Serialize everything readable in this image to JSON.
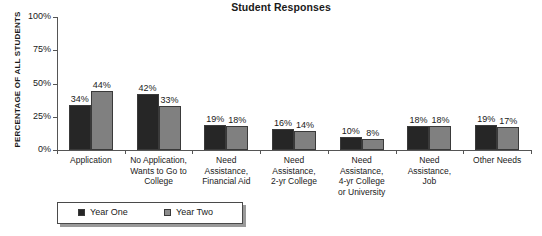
{
  "chart_data": {
    "type": "bar",
    "title": "Student Responses",
    "xlabel": "",
    "ylabel": "PERCENTAGE OF ALL STUDENTS",
    "ylim": [
      0,
      100
    ],
    "ytick_labels": [
      "0%",
      "25%",
      "50%",
      "75%",
      "100%"
    ],
    "ytick_values": [
      0,
      25,
      50,
      75,
      100
    ],
    "grid": false,
    "legend_position": "bottom-left",
    "categories": [
      "Application",
      "No Application, Wants to Go to College",
      "Need Assistance, Financial Aid",
      "Need Assistance, 2-yr College",
      "Need Assistance, 4-yr College or University",
      "Need Assistance, Job",
      "Other Needs"
    ],
    "category_lines": [
      [
        "Application"
      ],
      [
        "No Application,",
        "Wants to Go to",
        "College"
      ],
      [
        "Need",
        "Assistance,",
        "Financial Aid"
      ],
      [
        "Need",
        "Assistance,",
        "2-yr College"
      ],
      [
        "Need",
        "Assistance,",
        "4-yr College",
        "or University"
      ],
      [
        "Need",
        "Assistance,",
        "Job"
      ],
      [
        "Other Needs"
      ]
    ],
    "series": [
      {
        "name": "Year One",
        "color": "#262626",
        "values": [
          34,
          42,
          19,
          16,
          10,
          18,
          19
        ],
        "labels": [
          "34%",
          "42%",
          "19%",
          "16%",
          "10%",
          "18%",
          "19%"
        ]
      },
      {
        "name": "Year Two",
        "color": "#808080",
        "values": [
          44,
          33,
          18,
          14,
          8,
          18,
          17
        ],
        "labels": [
          "44%",
          "33%",
          "18%",
          "14%",
          "8%",
          "18%",
          "17%"
        ]
      }
    ]
  },
  "legend": {
    "entries": [
      {
        "label": "Year One"
      },
      {
        "label": "Year Two"
      }
    ]
  }
}
